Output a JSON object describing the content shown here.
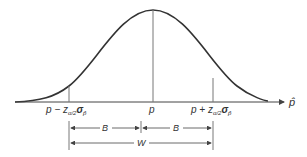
{
  "diagram": {
    "type": "normal-distribution-confidence-interval",
    "axis_label": "p̂",
    "center_label": "p",
    "lower_label": {
      "base": "p − z",
      "sub1": "α/2",
      "sigma": "σ",
      "sub2": "p̂"
    },
    "upper_label": {
      "base": "p + z",
      "sub1": "α/2",
      "sigma": "σ",
      "sub2": "p̂"
    },
    "bound_left_label": "B",
    "bound_right_label": "B",
    "width_label": "W",
    "colors": {
      "curve": "#333333",
      "lines": "#555555",
      "text": "#333333",
      "background": "#ffffff"
    }
  }
}
